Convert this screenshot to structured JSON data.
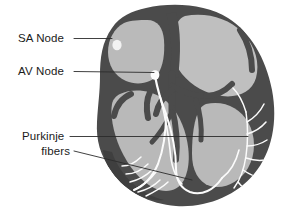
{
  "figure": {
    "background_color": "#ffffff",
    "width": 282,
    "height": 214
  },
  "colors": {
    "background": "#ffffff",
    "myocardium_wall": "#4b4b4b",
    "wall_shadow": "#3a3a3a",
    "chamber_fill": "#b7b7b7",
    "chamber_fill_light": "#c2c2c2",
    "conduction_fiber": "#fdfdfd",
    "node_marker": "#ffffff",
    "leader_line": "#2b2b2b",
    "label_text": "#1b1b1b"
  },
  "labels": [
    {
      "id": "sa-node",
      "text": "SA Node",
      "x": 18,
      "y": 42,
      "align": "start",
      "leader": "M 74 38.5 L 112 38.5",
      "target_x": 112,
      "target_y": 38.5
    },
    {
      "id": "av-node",
      "text": "AV Node",
      "x": 18,
      "y": 75,
      "align": "start",
      "leader": "M 74 71.5 L 154 72.5",
      "target_x": 154,
      "target_y": 72.5
    },
    {
      "id": "purkinje-fibers-line1",
      "text": "Purkinje",
      "x": 22,
      "y": 140,
      "align": "start",
      "leader": "M 70 136.5 L 248 136.5",
      "target_x": 248,
      "target_y": 136.5
    },
    {
      "id": "purkinje-fibers-line2",
      "text": "fibers",
      "x": 70,
      "y": 155,
      "align": "end",
      "leader": "M 74 151 L 192 180",
      "target_x": 192,
      "target_y": 180
    }
  ],
  "anatomy": {
    "heart_outline_name": "heart-silhouette",
    "structures": [
      {
        "id": "right-atrium",
        "name": "Right atrium chamber"
      },
      {
        "id": "left-atrium",
        "name": "Left atrium chamber"
      },
      {
        "id": "right-ventricle",
        "name": "Right ventricle chamber"
      },
      {
        "id": "left-ventricle",
        "name": "Left ventricle chamber"
      },
      {
        "id": "sa-node-marker",
        "name": "Sinoatrial node",
        "cx": 117,
        "cy": 45,
        "r": 4.2
      },
      {
        "id": "av-node-marker",
        "name": "Atrioventricular node",
        "cx": 155,
        "cy": 75,
        "r": 4.0
      },
      {
        "id": "bundle-of-his",
        "name": "Bundle of His"
      },
      {
        "id": "left-bundle-branch",
        "name": "Left bundle branch"
      },
      {
        "id": "right-bundle-branch",
        "name": "Right bundle branch"
      },
      {
        "id": "purkinje-network-left",
        "name": "Purkinje fiber network, left wall"
      },
      {
        "id": "purkinje-network-right",
        "name": "Purkinje fiber network, right wall"
      }
    ]
  }
}
